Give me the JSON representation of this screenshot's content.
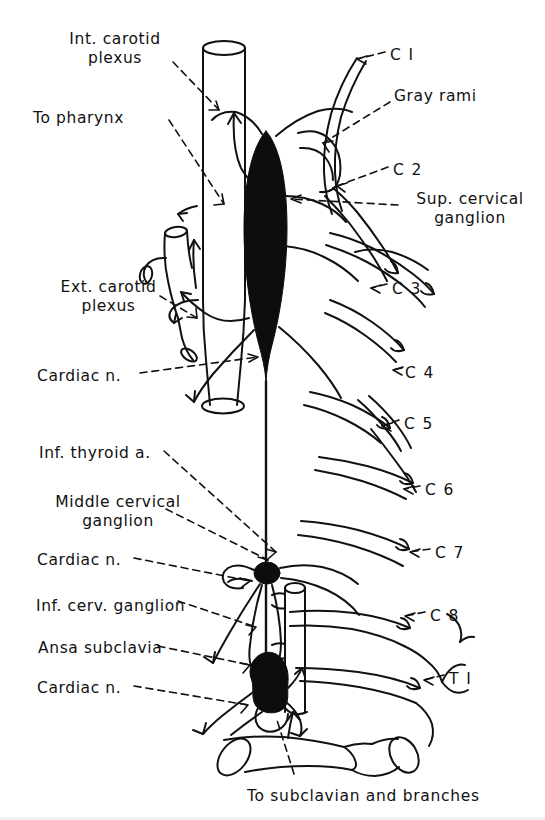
{
  "figure": {
    "background_color": "#ffffff",
    "ink_color": "#111111",
    "ganglion_fill": "#0d0d0d"
  },
  "labels_left": [
    {
      "id": "int-carotid-plexus",
      "text": "Int. carotid\nplexus",
      "x": 45,
      "y": 30,
      "lines": 2
    },
    {
      "id": "to-pharynx",
      "text": "To pharynx",
      "x": 33,
      "y": 109,
      "lines": 1
    },
    {
      "id": "ext-carotid-plexus",
      "text": "Ext. carotid\nplexus",
      "x": 36,
      "y": 278,
      "lines": 2
    },
    {
      "id": "cardiac-n-upper",
      "text": "Cardiac n.",
      "x": 37,
      "y": 367,
      "lines": 1
    },
    {
      "id": "inf-thyroid-a",
      "text": "Inf. thyroid a.",
      "x": 39,
      "y": 444,
      "lines": 1
    },
    {
      "id": "middle-cervical-ganglion",
      "text": "Middle cervical\nganglion",
      "x": 38,
      "y": 493,
      "lines": 2
    },
    {
      "id": "cardiac-n-middle",
      "text": "Cardiac n.",
      "x": 37,
      "y": 551,
      "lines": 1
    },
    {
      "id": "inf-cerv-ganglion",
      "text": "Inf. cerv. ganglion",
      "x": 36,
      "y": 597,
      "lines": 1
    },
    {
      "id": "ansa-subclavia",
      "text": "Ansa subclavia",
      "x": 38,
      "y": 639,
      "lines": 1
    },
    {
      "id": "cardiac-n-lower",
      "text": "Cardiac n.",
      "x": 37,
      "y": 679,
      "lines": 1
    }
  ],
  "labels_right": [
    {
      "id": "gray-rami",
      "text": "Gray rami",
      "x": 394,
      "y": 87
    },
    {
      "id": "sup-cervical-ganglion",
      "text": "Sup. cervical\nganglion",
      "x": 401,
      "y": 190,
      "lines": 2
    }
  ],
  "segment_labels": [
    {
      "id": "c1",
      "text": "C I",
      "x": 390,
      "y": 46
    },
    {
      "id": "c2",
      "text": "C 2",
      "x": 393,
      "y": 161
    },
    {
      "id": "c3",
      "text": "C 3",
      "x": 392,
      "y": 280
    },
    {
      "id": "c4",
      "text": "C 4",
      "x": 405,
      "y": 364
    },
    {
      "id": "c5",
      "text": "C 5",
      "x": 404,
      "y": 415
    },
    {
      "id": "c6",
      "text": "C 6",
      "x": 425,
      "y": 481
    },
    {
      "id": "c7",
      "text": "C 7",
      "x": 435,
      "y": 544
    },
    {
      "id": "c8",
      "text": "C 8",
      "x": 430,
      "y": 607
    },
    {
      "id": "t1",
      "text": "T I",
      "x": 449,
      "y": 670
    }
  ],
  "caption": {
    "id": "bottom-caption",
    "text": "To subclavian and branches",
    "x": 247,
    "y": 787
  }
}
